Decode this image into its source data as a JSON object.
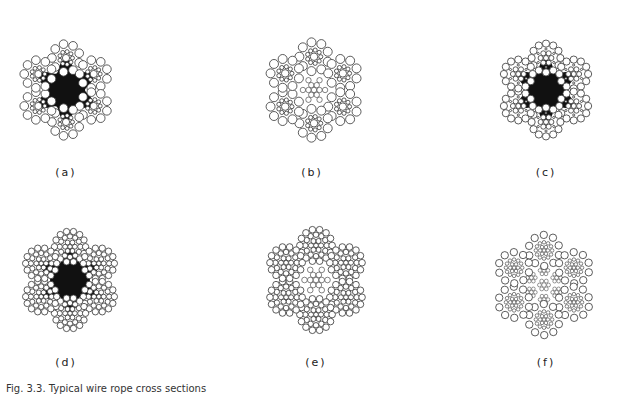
{
  "figure": {
    "panels": [
      {
        "id": "a",
        "label": "(a)",
        "core": "fiber",
        "strand_type": "seale",
        "strands": 6
      },
      {
        "id": "b",
        "label": "(b)",
        "core": "iwrc",
        "strand_type": "seale",
        "strands": 6
      },
      {
        "id": "c",
        "label": "(c)",
        "core": "fiber",
        "strand_type": "filler",
        "strands": 6
      },
      {
        "id": "d",
        "label": "(d)",
        "core": "fiber",
        "strand_type": "warrington-seale",
        "strands": 6
      },
      {
        "id": "e",
        "label": "(e)",
        "core": "iwrc",
        "strand_type": "warrington-seale",
        "strands": 6
      },
      {
        "id": "f",
        "label": "(f)",
        "core": "iwrc-stranded",
        "strand_type": "filler-fine",
        "strands": 6
      }
    ],
    "caption": "Fig. 3.3. Typical wire rope cross sections",
    "colors": {
      "wire_stroke": "#333333",
      "wire_fill": "#ffffff",
      "core_fill": "#111111"
    }
  }
}
